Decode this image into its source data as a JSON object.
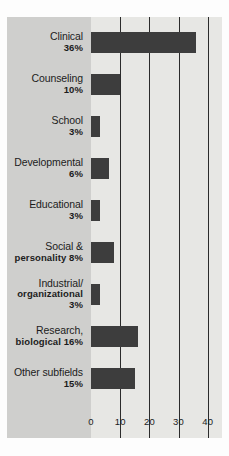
{
  "chart_data": {
    "type": "bar",
    "orientation": "horizontal",
    "title": "",
    "subtitle": "",
    "xlabel": "",
    "ylabel": "",
    "xlim": [
      0,
      45
    ],
    "xticks": [
      "0",
      "10",
      "20",
      "30",
      "40"
    ],
    "xtick_values": [
      0,
      10,
      20,
      30,
      40
    ],
    "grid": "vertical",
    "gridlines_at": [
      10,
      20,
      30,
      40
    ],
    "legend": "none",
    "categories": [
      "Clinical",
      "Counseling",
      "School",
      "Developmental",
      "Educational",
      "Social & personality",
      "Industrial/ organizational",
      "Research, biological",
      "Other subfields"
    ],
    "values": [
      36,
      10,
      3,
      6,
      3,
      8,
      3,
      16,
      15
    ],
    "value_labels": [
      "36%",
      "10%",
      "3%",
      "6%",
      "3%",
      "8%",
      "3%",
      "16%",
      "15%"
    ],
    "bars": [
      {
        "name": "Clinical",
        "label_lines": [
          "Clinical"
        ],
        "pct": "36%",
        "value": 36,
        "pct_inline": false
      },
      {
        "name": "Counseling",
        "label_lines": [
          "Counseling"
        ],
        "pct": "10%",
        "value": 10,
        "pct_inline": false
      },
      {
        "name": "School",
        "label_lines": [
          "School"
        ],
        "pct": "3%",
        "value": 3,
        "pct_inline": false
      },
      {
        "name": "Developmental",
        "label_lines": [
          "Developmental"
        ],
        "pct": "6%",
        "value": 6,
        "pct_inline": false
      },
      {
        "name": "Educational",
        "label_lines": [
          "Educational"
        ],
        "pct": "3%",
        "value": 3,
        "pct_inline": false
      },
      {
        "name": "Social & personality",
        "label_lines": [
          "Social &"
        ],
        "pct": "personality 8%",
        "value": 8,
        "pct_inline": true
      },
      {
        "name": "Industrial/ organizational",
        "label_lines": [
          "Industrial/"
        ],
        "pct": "organizational 3%",
        "value": 3,
        "pct_inline": true
      },
      {
        "name": "Research, biological",
        "label_lines": [
          "Research,"
        ],
        "pct": "biological 16%",
        "value": 16,
        "pct_inline": true
      },
      {
        "name": "Other subfields",
        "label_lines": [
          "Other subfields"
        ],
        "pct": "15%",
        "value": 15,
        "pct_inline": false
      }
    ]
  },
  "colors": {
    "bar": "#3d3d3d",
    "label_panel_background": "#cfcfcd",
    "plot_background": "#e7e7e4",
    "gridline": "#2b2b2b",
    "text": "#1c1c1c",
    "page_background": "#fdfdfd"
  }
}
